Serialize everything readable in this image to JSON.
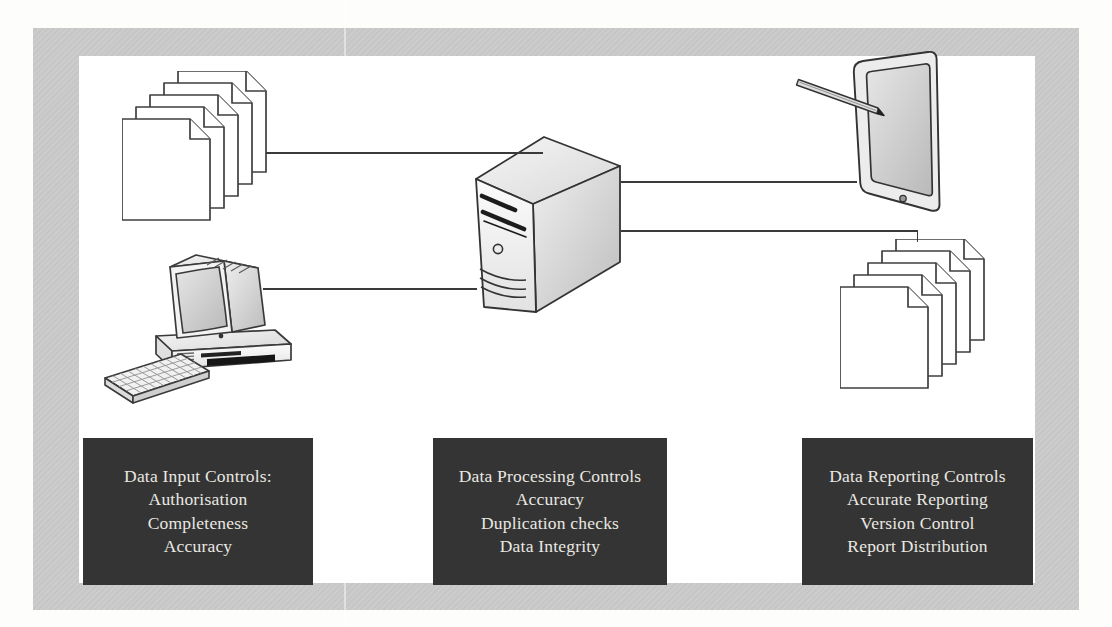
{
  "diagram": {
    "boxes": [
      {
        "lines": [
          "Data Input Controls:",
          "Authorisation",
          "Completeness",
          "Accuracy"
        ]
      },
      {
        "lines": [
          "Data Processing Controls",
          "Accuracy",
          "Duplication checks",
          "Data Integrity"
        ]
      },
      {
        "lines": [
          "Data Reporting Controls",
          "Accurate Reporting",
          "Version Control",
          "Report Distribution"
        ]
      }
    ],
    "icons": {
      "input_documents": "documents-stack-icon",
      "input_computer": "desktop-computer-icon",
      "processor": "server-icon",
      "output_tablet": "tablet-stylus-icon",
      "output_documents": "documents-stack-icon"
    },
    "colors": {
      "frame": "#c9c9c9",
      "canvas": "#ffffff",
      "box_background": "#343434",
      "box_text": "#eae8e2",
      "connector": "#3a3a3a"
    }
  }
}
